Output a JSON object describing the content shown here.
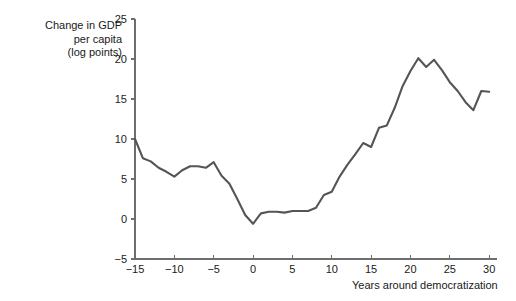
{
  "figure": {
    "background_color": "#ffffff",
    "line_color": "#555555",
    "axis_color": "#6e6e6e",
    "text_color": "#1a1a1a"
  },
  "ylabel_lines": {
    "line1": "Change in GDP",
    "line2": "per capita",
    "line3": "(log points)"
  },
  "xlabel": "Years around democratization",
  "chart_data": {
    "type": "line",
    "title": "",
    "subtitle": "",
    "xlabel": "Years around democratization",
    "ylabel": "Change in GDP per capita (log points)",
    "xlim": [
      -15,
      31
    ],
    "ylim": [
      -5,
      25
    ],
    "xticks": [
      -15,
      -10,
      -5,
      0,
      5,
      10,
      15,
      20,
      25,
      30
    ],
    "xtick_labels": [
      "−15",
      "−10",
      "−5",
      "0",
      "5",
      "10",
      "15",
      "20",
      "25",
      "30"
    ],
    "yticks": [
      -5,
      0,
      5,
      10,
      15,
      20,
      25
    ],
    "ytick_labels": [
      "−5",
      "0",
      "5",
      "10",
      "15",
      "20",
      "25"
    ],
    "grid": false,
    "legend": false,
    "legend_position": "none",
    "series": [
      {
        "name": "Change in GDP per capita",
        "color": "#555555",
        "linewidth": 2.1,
        "x": [
          -15,
          -14,
          -13,
          -12,
          -11,
          -10,
          -9,
          -8,
          -7,
          -6,
          -5,
          -4,
          -3,
          -2,
          -1,
          0,
          1,
          2,
          3,
          4,
          5,
          6,
          7,
          8,
          9,
          10,
          11,
          12,
          13,
          14,
          15,
          16,
          17,
          18,
          19,
          20,
          21,
          22,
          23,
          24,
          25,
          26,
          27,
          28,
          29,
          30
        ],
        "values": [
          10.0,
          7.6,
          7.2,
          6.4,
          5.9,
          5.3,
          6.1,
          6.6,
          6.6,
          6.4,
          7.1,
          5.4,
          4.4,
          2.5,
          0.5,
          -0.6,
          0.7,
          0.9,
          0.9,
          0.8,
          1.0,
          1.0,
          1.0,
          1.4,
          3.0,
          3.4,
          5.3,
          6.8,
          8.1,
          9.5,
          9.0,
          11.4,
          11.7,
          13.9,
          16.6,
          18.5,
          20.1,
          19.0,
          19.9,
          18.6,
          17.1,
          16.0,
          14.6,
          13.6,
          16.0,
          15.9
        ]
      }
    ]
  }
}
